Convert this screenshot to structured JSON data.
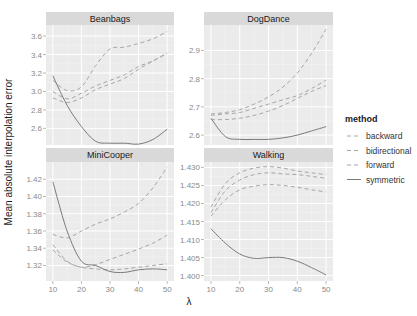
{
  "chart_data": {
    "type": "line",
    "layout": "facet_wrap 2x2, free y scales",
    "xlabel": "λ",
    "ylabel": "Mean absolute interpolation error",
    "x": [
      10,
      15,
      20,
      25,
      30,
      35,
      40,
      45,
      50
    ],
    "x_ticks": [
      10,
      20,
      30,
      40,
      50
    ],
    "grid": true,
    "legend": {
      "title": "method",
      "position": "right",
      "entries": [
        {
          "name": "backward",
          "linetype": "dashed"
        },
        {
          "name": "bidirectional",
          "linetype": "dashed"
        },
        {
          "name": "forward",
          "linetype": "dashed"
        },
        {
          "name": "symmetric",
          "linetype": "solid"
        }
      ]
    },
    "panels": [
      {
        "title": "Beanbags",
        "ylim": [
          2.42,
          3.72
        ],
        "y_ticks": [
          2.6,
          2.8,
          3.0,
          3.2,
          3.4,
          3.6
        ],
        "y_tick_labels": [
          "2.6",
          "2.8",
          "3.0",
          "3.2",
          "3.4",
          "3.6"
        ],
        "series": [
          {
            "name": "backward",
            "values": [
              3.12,
              3.01,
              3.05,
              3.28,
              3.46,
              3.48,
              3.52,
              3.57,
              3.65
            ]
          },
          {
            "name": "bidirectional",
            "values": [
              2.93,
              2.88,
              2.93,
              3.02,
              3.08,
              3.14,
              3.24,
              3.33,
              3.41
            ]
          },
          {
            "name": "forward",
            "values": [
              3.0,
              2.92,
              2.98,
              3.06,
              3.12,
              3.18,
              3.27,
              3.33,
              3.42
            ]
          },
          {
            "name": "symmetric",
            "values": [
              3.17,
              2.85,
              2.62,
              2.46,
              2.44,
              2.44,
              2.43,
              2.48,
              2.59
            ]
          }
        ]
      },
      {
        "title": "DogDance",
        "ylim": [
          2.565,
          2.99
        ],
        "y_ticks": [
          2.6,
          2.7,
          2.8,
          2.9
        ],
        "y_tick_labels": [
          "2.6",
          "2.7",
          "2.8",
          "2.9"
        ],
        "series": [
          {
            "name": "backward",
            "values": [
              2.675,
              2.68,
              2.69,
              2.71,
              2.735,
              2.77,
              2.82,
              2.89,
              2.975
            ]
          },
          {
            "name": "bidirectional",
            "values": [
              2.655,
              2.655,
              2.66,
              2.67,
              2.685,
              2.705,
              2.73,
              2.755,
              2.775
            ]
          },
          {
            "name": "forward",
            "values": [
              2.67,
              2.675,
              2.68,
              2.695,
              2.71,
              2.725,
              2.74,
              2.765,
              2.795
            ]
          },
          {
            "name": "symmetric",
            "values": [
              2.66,
              2.595,
              2.585,
              2.585,
              2.585,
              2.59,
              2.6,
              2.615,
              2.63
            ]
          }
        ]
      },
      {
        "title": "MiniCooper",
        "ylim": [
          1.302,
          1.44
        ],
        "y_ticks": [
          1.32,
          1.34,
          1.36,
          1.38,
          1.4,
          1.42
        ],
        "y_tick_labels": [
          "1.32",
          "1.34",
          "1.36",
          "1.38",
          "1.40",
          "1.42"
        ],
        "series": [
          {
            "name": "backward",
            "values": [
              1.356,
              1.352,
              1.36,
              1.368,
              1.374,
              1.382,
              1.392,
              1.41,
              1.434
            ]
          },
          {
            "name": "bidirectional",
            "values": [
              1.344,
              1.325,
              1.318,
              1.321,
              1.327,
              1.333,
              1.339,
              1.346,
              1.355
            ]
          },
          {
            "name": "forward",
            "values": [
              1.338,
              1.324,
              1.318,
              1.316,
              1.315,
              1.316,
              1.318,
              1.32,
              1.322
            ]
          },
          {
            "name": "symmetric",
            "values": [
              1.417,
              1.36,
              1.325,
              1.32,
              1.313,
              1.312,
              1.315,
              1.316,
              1.315
            ]
          }
        ]
      },
      {
        "title": "Walking",
        "ylim": [
          1.3985,
          1.4315
        ],
        "y_ticks": [
          1.4,
          1.405,
          1.41,
          1.415,
          1.42,
          1.425,
          1.43
        ],
        "y_tick_labels": [
          "1.400",
          "1.405",
          "1.410",
          "1.415",
          "1.420",
          "1.425",
          "1.430"
        ],
        "series": [
          {
            "name": "backward",
            "values": [
              1.419,
              1.4255,
              1.4285,
              1.4298,
              1.4302,
              1.4298,
              1.429,
              1.4285,
              1.428
            ]
          },
          {
            "name": "bidirectional",
            "values": [
              1.4175,
              1.4235,
              1.4265,
              1.428,
              1.4285,
              1.4282,
              1.428,
              1.4275,
              1.427
            ]
          },
          {
            "name": "forward",
            "values": [
              1.4165,
              1.421,
              1.4238,
              1.4248,
              1.4252,
              1.425,
              1.4245,
              1.4238,
              1.4232
            ]
          },
          {
            "name": "symmetric",
            "values": [
              1.413,
              1.409,
              1.406,
              1.4048,
              1.405,
              1.405,
              1.404,
              1.4022,
              1.4002
            ]
          }
        ]
      }
    ]
  },
  "style": {
    "panel_bg": "#ebebeb",
    "strip_bg": "#d9d9d9",
    "grid_major": "#ffffff",
    "grid_minor": "#f4f4f4",
    "line_colors": {
      "backward": "#a6a6a6",
      "bidirectional": "#a6a6a6",
      "forward": "#a6a6a6",
      "symmetric": "#7a7a7a"
    }
  }
}
